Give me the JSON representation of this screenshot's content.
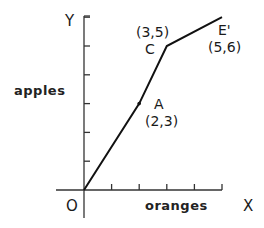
{
  "chart_data": {
    "type": "line",
    "title": "",
    "xlabel": "oranges",
    "ylabel": "apples",
    "x_axis_letter": "X",
    "y_axis_letter": "Y",
    "origin_label": "O",
    "xlim": [
      0,
      5
    ],
    "ylim": [
      0,
      6
    ],
    "x_ticks": [
      1,
      2,
      3,
      4,
      5
    ],
    "y_ticks": [
      1,
      2,
      3,
      4,
      5,
      6
    ],
    "tick_labels_shown": false,
    "grid": false,
    "legend": null,
    "series": [
      {
        "name": "path O-A-C-E'",
        "x": [
          0,
          2,
          3,
          5
        ],
        "y": [
          0,
          3,
          5,
          6
        ]
      }
    ],
    "annotations": [
      {
        "name": "A",
        "coords": "(2,3)",
        "x": 2,
        "y": 3,
        "marked": true
      },
      {
        "name": "C",
        "coords": "(3,5)",
        "x": 3,
        "y": 5,
        "marked": false
      },
      {
        "name": "E'",
        "coords": "(5,6)",
        "x": 5,
        "y": 6,
        "marked": false
      }
    ]
  },
  "labels": {
    "y_letter": "Y",
    "x_letter": "X",
    "origin": "O",
    "y_word": "apples",
    "x_word": "oranges",
    "point_a_name": "A",
    "point_a_coords": "(2,3)",
    "point_c_name": "C",
    "point_c_coords": "(3,5)",
    "point_e_name": "E'",
    "point_e_coords": "(5,6)"
  },
  "colors": {
    "line": "#111111",
    "axis": "#333333",
    "background": "#ffffff"
  }
}
